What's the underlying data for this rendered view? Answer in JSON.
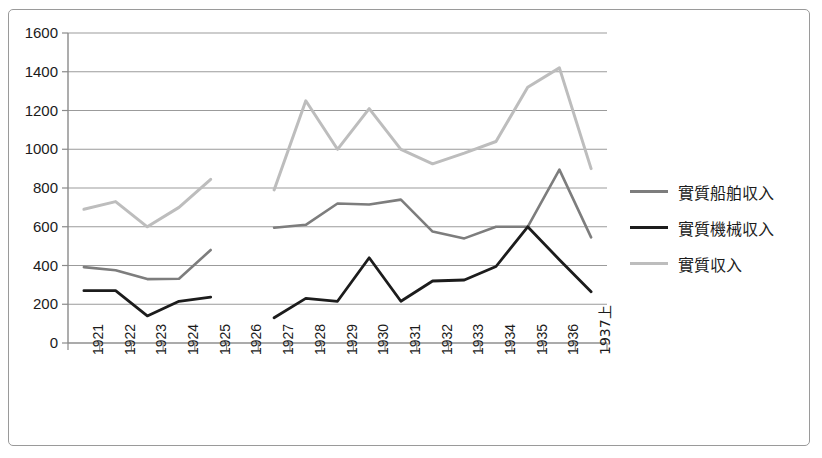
{
  "chart_data": {
    "type": "line",
    "title": "",
    "subtitle": "",
    "xlabel": "",
    "ylabel": "",
    "grid": true,
    "grid_axis": "y",
    "legend_position": "right",
    "xlim_categories": 17,
    "ylim": [
      0,
      1600
    ],
    "ytick_step": 200,
    "ytick_labels": [
      "1600",
      "1400",
      "1200",
      "1000",
      "800",
      "600",
      "400",
      "200",
      "0"
    ],
    "ytick_values": [
      1600,
      1400,
      1200,
      1000,
      800,
      600,
      400,
      200,
      0
    ],
    "categories": [
      "1921",
      "1922",
      "1923",
      "1924",
      "1925",
      "1926",
      "1927",
      "1928",
      "1929",
      "1930",
      "1931",
      "1932",
      "1933",
      "1934",
      "1935",
      "1936",
      "1937上"
    ],
    "note_missing_category": "1926",
    "series": [
      {
        "name": "實質船舶収入",
        "color": "#7d7d7d",
        "linewidth": 2.6,
        "values": [
          392,
          375,
          330,
          332,
          480,
          null,
          595,
          610,
          720,
          715,
          740,
          575,
          540,
          600,
          600,
          895,
          545
        ]
      },
      {
        "name": "實質機械収入",
        "color": "#1c1c1c",
        "linewidth": 2.8,
        "values": [
          270,
          270,
          140,
          215,
          237,
          null,
          130,
          230,
          215,
          440,
          215,
          320,
          325,
          395,
          600,
          430,
          265
        ]
      },
      {
        "name": "實質収入",
        "color": "#bdbdbd",
        "linewidth": 3.0,
        "values": [
          690,
          730,
          600,
          700,
          845,
          null,
          790,
          1250,
          1000,
          1210,
          1000,
          925,
          980,
          1040,
          1320,
          1420,
          900
        ]
      }
    ]
  },
  "legend": {
    "items": [
      {
        "label": "實質船舶収入",
        "color": "#7d7d7d"
      },
      {
        "label": "實質機械収入",
        "color": "#1c1c1c"
      },
      {
        "label": "實質収入",
        "color": "#bdbdbd"
      }
    ]
  },
  "axis_colors": {
    "gridline": "#9b9b9b",
    "axis": "#8a8a8a",
    "frame": "#9a9a9a",
    "text": "#1b1b1b"
  }
}
